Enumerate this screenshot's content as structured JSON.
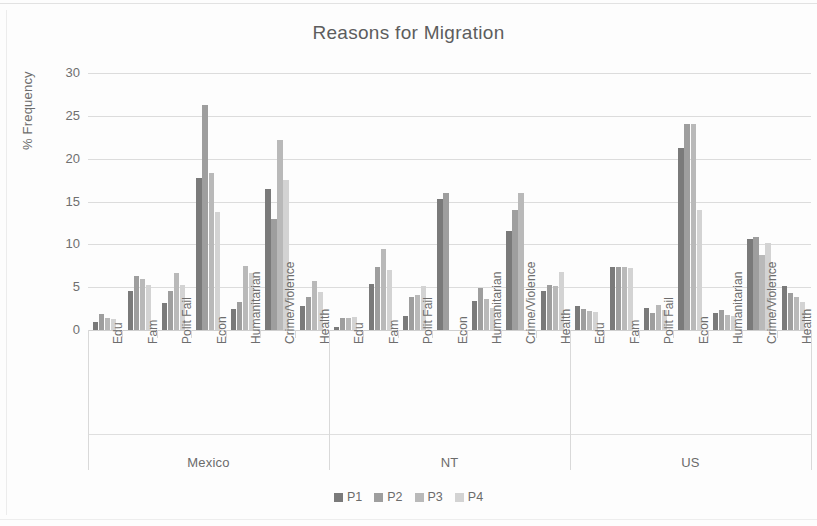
{
  "chart_data": {
    "type": "bar",
    "title": "Reasons for Migration",
    "xlabel": "",
    "ylabel": "% Frequency",
    "ylim": [
      0,
      30
    ],
    "yticks": [
      0,
      5,
      10,
      15,
      20,
      25,
      30
    ],
    "grid": true,
    "legend_position": "bottom",
    "groups": [
      "Mexico",
      "NT",
      "US"
    ],
    "categories": [
      "Edu",
      "Fam",
      "Polit Fail",
      "Econ",
      "Humanitarian",
      "Crime/Violence",
      "Health"
    ],
    "series_names": [
      "P1",
      "P2",
      "P3",
      "P4"
    ],
    "series_colors": [
      "#7a7a7a",
      "#9e9e9e",
      "#b9b9b9",
      "#d3d3d3"
    ],
    "series": [
      {
        "name": "P1",
        "color": "#7a7a7a",
        "values_by_group": {
          "Mexico": [
            0.9,
            4.6,
            3.2,
            17.8,
            2.4,
            16.5,
            2.8
          ],
          "NT": [
            0.4,
            5.4,
            1.6,
            15.3,
            3.4,
            11.5,
            4.6
          ],
          "US": [
            2.8,
            7.4,
            2.6,
            21.3,
            2.0,
            10.6,
            5.1
          ]
        }
      },
      {
        "name": "P2",
        "color": "#9e9e9e",
        "values_by_group": {
          "Mexico": [
            1.9,
            6.3,
            4.5,
            26.3,
            3.3,
            13.0,
            3.8
          ],
          "NT": [
            1.4,
            7.4,
            3.9,
            16.0,
            4.9,
            14.0,
            5.2
          ],
          "US": [
            2.5,
            7.3,
            2.0,
            24.0,
            2.3,
            10.8,
            4.3
          ]
        }
      },
      {
        "name": "P3",
        "color": "#b9b9b9",
        "values_by_group": {
          "Mexico": [
            1.4,
            6.0,
            6.6,
            18.3,
            7.5,
            22.2,
            5.7
          ],
          "NT": [
            1.4,
            9.4,
            4.1,
            0,
            3.6,
            16.0,
            5.1
          ],
          "US": [
            2.2,
            7.3,
            2.9,
            24.0,
            1.8,
            8.7,
            3.8
          ]
        }
      },
      {
        "name": "P4",
        "color": "#d3d3d3",
        "values_by_group": {
          "Mexico": [
            1.3,
            5.2,
            5.2,
            13.8,
            6.6,
            17.5,
            4.4
          ],
          "NT": [
            1.5,
            7.0,
            5.1,
            0,
            2.6,
            0,
            6.8
          ],
          "US": [
            2.1,
            7.2,
            2.3,
            14.0,
            1.6,
            10.1,
            3.3
          ]
        }
      }
    ]
  },
  "legend": {
    "items": [
      {
        "label": "P1",
        "color": "#7a7a7a"
      },
      {
        "label": "P2",
        "color": "#9e9e9e"
      },
      {
        "label": "P3",
        "color": "#b9b9b9"
      },
      {
        "label": "P4",
        "color": "#d3d3d3"
      }
    ]
  }
}
